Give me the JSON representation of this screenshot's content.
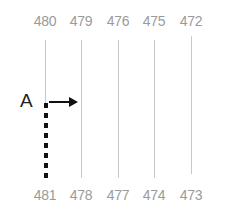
{
  "diagram": {
    "top_labels": [
      "480",
      "479",
      "476",
      "475",
      "472"
    ],
    "bottom_labels": [
      "481",
      "478",
      "477",
      "474",
      "473"
    ],
    "marker_label": "A",
    "colors": {
      "label": "#9a9a9a",
      "line": "#c8c8c8",
      "marker": "#111111"
    }
  }
}
